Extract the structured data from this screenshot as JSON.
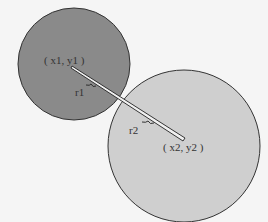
{
  "diagram": {
    "circle1": {
      "center_label": "( x1, y1 )",
      "radius_label": "r1",
      "fill": "#888888",
      "cx": 74,
      "cy": 64,
      "r": 56
    },
    "circle2": {
      "center_label": "( x2, y2 )",
      "radius_label": "r2",
      "fill": "#cfcfcf",
      "cx": 184,
      "cy": 146,
      "r": 76
    },
    "stroke": "#333333"
  }
}
